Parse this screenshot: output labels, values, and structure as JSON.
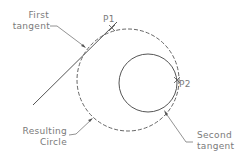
{
  "diagram": {
    "labels": {
      "first_tangent_line1": "First",
      "first_tangent_line2": "tangent",
      "p1": "P1",
      "p2": "P2",
      "resulting_line1": "Resulting",
      "resulting_line2": "Circle",
      "second_tangent_line1": "Second",
      "second_tangent_line2": "tangent"
    },
    "elements": {
      "tangent_line": {
        "x1": 33,
        "y1": 105,
        "x2": 117,
        "y2": 22
      },
      "resulting_circle": {
        "cx": 128,
        "cy": 80,
        "r": 51,
        "style": "dashed"
      },
      "existing_circle": {
        "cx": 148,
        "cy": 83,
        "r": 29,
        "style": "solid"
      },
      "p1_point": {
        "x": 112,
        "y": 28
      },
      "p2_point": {
        "x": 177,
        "y": 80
      }
    },
    "colors": {
      "line": "#555555",
      "text": "#7a7a7a",
      "background": "#ffffff"
    }
  }
}
